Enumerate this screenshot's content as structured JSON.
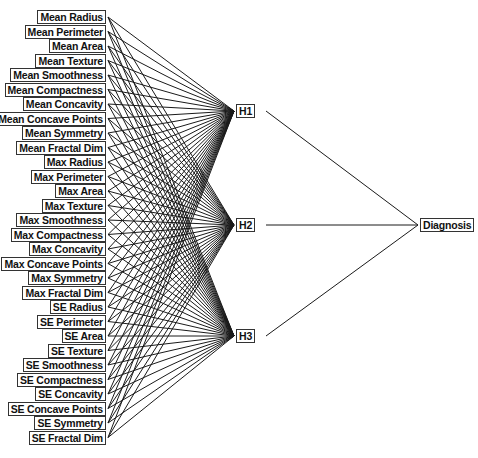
{
  "diagram": {
    "type": "neural-network",
    "inputs": [
      "Mean Radius",
      "Mean Perimeter",
      "Mean Area",
      "Mean Texture",
      "Mean Smoothness",
      "Mean Compactness",
      "Mean Concavity",
      "Mean Concave Points",
      "Mean Symmetry",
      "Mean Fractal Dim",
      "Max Radius",
      "Max Perimeter",
      "Max Area",
      "Max Texture",
      "Max Smoothness",
      "Max Compactness",
      "Max Concavity",
      "Max Concave Points",
      "Max Symmetry",
      "Max Fractal Dim",
      "SE Radius",
      "SE Perimeter",
      "SE Area",
      "SE Texture",
      "SE Smoothness",
      "SE Compactness",
      "SE Concavity",
      "SE Concave Points",
      "SE Symmetry",
      "SE Fractal Dim"
    ],
    "hidden": [
      "H1",
      "H2",
      "H3"
    ],
    "output": "Diagnosis",
    "colors": {
      "line": "#1a1a1a",
      "border": "#333333",
      "text": "#111111"
    }
  }
}
